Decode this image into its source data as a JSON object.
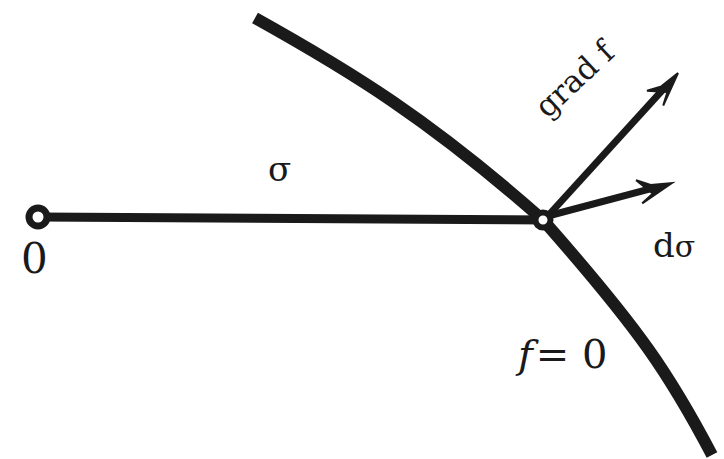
{
  "figure": {
    "kind": "vector-diagram",
    "width": 724,
    "height": 459,
    "background_color": "#ffffff",
    "ink_color": "#1a1a1a"
  },
  "labels": {
    "origin": "0",
    "curve_parameter": "σ",
    "gradient": "grad f",
    "differential_d": "d",
    "differential_sigma": "σ",
    "level_set": "f = 0",
    "level_set_f": "f",
    "level_set_rest": "= 0"
  },
  "geometry": {
    "open_circle_origin": {
      "cx": 38,
      "cy": 217,
      "r": 9,
      "stroke_width": 7
    },
    "open_circle_node": {
      "cx": 543,
      "cy": 220,
      "r": 7.5,
      "stroke_width": 6
    },
    "straight_segment": {
      "x1": 38,
      "y1": 217,
      "x2": 552,
      "y2": 220,
      "stroke_width": 9
    },
    "level_curve": {
      "start": [
        255,
        18
      ],
      "control_1": [
        430,
        120
      ],
      "through": [
        543,
        220
      ],
      "control_2": [
        640,
        330
      ],
      "end": [
        712,
        455
      ],
      "stroke_width": 12
    },
    "arrow_grad_f": {
      "x1": 546,
      "y1": 218,
      "x2": 678,
      "y2": 73,
      "stroke_width": 7,
      "head_length": 34,
      "head_half_width": 11
    },
    "arrow_d_sigma": {
      "x1": 548,
      "y1": 216,
      "x2": 672,
      "y2": 183,
      "stroke_width": 7,
      "head_length": 34,
      "head_half_width": 12
    }
  },
  "colors": {
    "ink": "#1a1a1a",
    "background": "#ffffff"
  }
}
